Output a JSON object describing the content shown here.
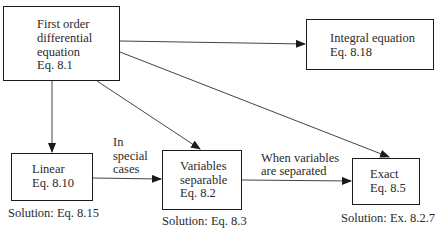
{
  "nodes": {
    "first_order": {
      "line1": "First order",
      "line2": "differential",
      "line3": "equation",
      "line4": "Eq. 8.1"
    },
    "integral": {
      "line1": "Integral equation",
      "line2": "Eq. 8.18"
    },
    "linear": {
      "line1": "Linear",
      "line2": "Eq. 8.10",
      "solution": "Solution: Eq. 8.15"
    },
    "variables": {
      "line1": "Variables",
      "line2": "separable",
      "line3": "Eq. 8.2",
      "solution": "Solution: Eq. 8.3"
    },
    "exact": {
      "line1": "Exact",
      "line2": "Eq. 8.5",
      "solution": "Solution: Ex. 8.2.7"
    }
  },
  "edge_labels": {
    "special_cases": {
      "line1": "In",
      "line2": "special",
      "line3": "cases"
    },
    "when_separated": {
      "line1": "When variables",
      "line2": "are separated"
    }
  },
  "edges": [
    {
      "from": "first_order",
      "to": "integral"
    },
    {
      "from": "first_order",
      "to": "linear"
    },
    {
      "from": "first_order",
      "to": "variables"
    },
    {
      "from": "first_order",
      "to": "exact"
    },
    {
      "from": "linear",
      "to": "variables",
      "label": "special_cases"
    },
    {
      "from": "variables",
      "to": "exact",
      "label": "when_separated"
    }
  ]
}
